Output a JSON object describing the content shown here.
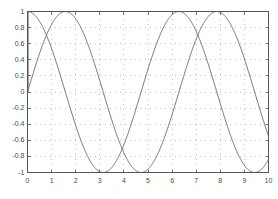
{
  "figure": {
    "background_color": "#ffffff",
    "axes_color": "#555555",
    "grid_color": "#9a9a9a",
    "curve_color": "#6b6b6b",
    "tick_label_color": "#4a4a4a"
  },
  "chart_data": {
    "type": "line",
    "title": "",
    "xlabel": "",
    "ylabel": "",
    "xlim": [
      0,
      10
    ],
    "ylim": [
      -1,
      1
    ],
    "grid": true,
    "grid_style": "dotted",
    "legend": "none",
    "xticks": [
      0,
      1,
      2,
      3,
      4,
      5,
      6,
      7,
      8,
      9,
      10
    ],
    "xtick_labels": [
      "0",
      "1",
      "2",
      "3",
      "4",
      "5",
      "6",
      "7",
      "8",
      "9",
      "10"
    ],
    "yticks": [
      -1,
      -0.8,
      -0.6,
      -0.4,
      -0.2,
      0,
      0.2,
      0.4,
      0.6,
      0.8,
      1
    ],
    "ytick_labels": [
      "-1",
      "-0.8",
      "-0.6",
      "-0.4",
      "-0.2",
      "0",
      "0.2",
      "0.4",
      "0.6",
      "0.8",
      "1"
    ],
    "series": [
      {
        "name": "cos(x)",
        "expression": "cos",
        "amplitude": 1,
        "frequency": 1,
        "phase": 1.5707963267948966,
        "color": "#6b6b6b",
        "linewidth": 1,
        "x": [
          0,
          0.25,
          0.5,
          0.75,
          1,
          1.25,
          1.5,
          1.75,
          2,
          2.25,
          2.5,
          2.75,
          3,
          3.25,
          3.5,
          3.75,
          4,
          4.25,
          4.5,
          4.75,
          5,
          5.25,
          5.5,
          5.75,
          6,
          6.25,
          6.5,
          6.75,
          7,
          7.25,
          7.5,
          7.75,
          8,
          8.25,
          8.5,
          8.75,
          9,
          9.25,
          9.5,
          9.75,
          10
        ],
        "values": [
          1,
          0.969,
          0.878,
          0.732,
          0.54,
          0.315,
          0.071,
          -0.178,
          -0.416,
          -0.628,
          -0.801,
          -0.924,
          -0.99,
          -0.994,
          -0.936,
          -0.821,
          -0.654,
          -0.447,
          -0.211,
          0.038,
          0.284,
          0.512,
          0.709,
          0.862,
          0.96,
          0.999,
          0.977,
          0.895,
          0.754,
          0.567,
          0.347,
          0.105,
          -0.146,
          -0.388,
          -0.604,
          -0.783,
          -0.911,
          -0.984,
          -0.997,
          -0.949,
          -0.839
        ]
      },
      {
        "name": "sin(x)",
        "expression": "sin",
        "amplitude": 1,
        "frequency": 1,
        "phase": 0,
        "color": "#6b6b6b",
        "linewidth": 1,
        "x": [
          0,
          0.25,
          0.5,
          0.75,
          1,
          1.25,
          1.5,
          1.75,
          2,
          2.25,
          2.5,
          2.75,
          3,
          3.25,
          3.5,
          3.75,
          4,
          4.25,
          4.5,
          4.75,
          5,
          5.25,
          5.5,
          5.75,
          6,
          6.25,
          6.5,
          6.75,
          7,
          7.25,
          7.5,
          7.75,
          8,
          8.25,
          8.5,
          8.75,
          9,
          9.25,
          9.5,
          9.75,
          10
        ],
        "values": [
          0,
          0.247,
          0.479,
          0.682,
          0.841,
          0.949,
          0.997,
          0.984,
          0.909,
          0.778,
          0.599,
          0.382,
          0.141,
          -0.108,
          -0.351,
          -0.572,
          -0.757,
          -0.895,
          -0.978,
          -0.999,
          -0.959,
          -0.859,
          -0.706,
          -0.507,
          -0.279,
          -0.034,
          0.215,
          0.446,
          0.657,
          0.824,
          0.938,
          0.994,
          0.989,
          0.922,
          0.798,
          0.623,
          0.412,
          0.176,
          -0.075,
          -0.318,
          -0.544
        ]
      }
    ],
    "annotations": [
      {
        "name": "vertical-edge-segment",
        "description": "near-vertical line segment at x=0 spanning y from 0 to 1",
        "x": 0,
        "y_start": 0,
        "y_end": 1
      }
    ],
    "peaks": [
      {
        "series": "cos(x)",
        "x": 0,
        "y": 1
      },
      {
        "series": "cos(x)",
        "x": 6.283,
        "y": 1
      },
      {
        "series": "sin(x)",
        "x": 1.571,
        "y": 1
      },
      {
        "series": "sin(x)",
        "x": 7.854,
        "y": 1
      }
    ],
    "troughs": [
      {
        "series": "cos(x)",
        "x": 3.142,
        "y": -1
      },
      {
        "series": "cos(x)",
        "x": 9.425,
        "y": -1
      },
      {
        "series": "sin(x)",
        "x": 4.712,
        "y": -1
      }
    ]
  }
}
